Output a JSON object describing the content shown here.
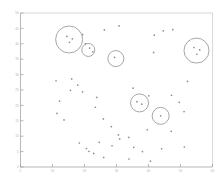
{
  "chart_data": {
    "type": "scatter",
    "title": "",
    "subtitle": "",
    "xlabel": "",
    "ylabel": "",
    "grid": false,
    "legend": "none",
    "xlim": [
      0,
      60
    ],
    "ylim": [
      0,
      50
    ],
    "xticks": [
      0,
      10,
      20,
      30,
      40,
      50,
      60
    ],
    "xticklabels": [
      "0",
      "10",
      "20",
      "30",
      "40",
      "50",
      "60"
    ],
    "yticks": [
      0,
      5,
      10,
      15,
      20,
      25,
      30,
      35,
      40,
      45,
      50
    ],
    "yticklabels": [
      "0",
      "5",
      "10",
      "15",
      "20",
      "25",
      "30",
      "35",
      "40",
      "45",
      "50"
    ],
    "series": [
      {
        "name": "points",
        "marker": "dot",
        "color": "#8d8d8d",
        "points": [
          {
            "x": 14.5,
            "y": 42.4
          },
          {
            "x": 16.2,
            "y": 41.6
          },
          {
            "x": 15.3,
            "y": 40.5
          },
          {
            "x": 19.4,
            "y": 43.0
          },
          {
            "x": 20.3,
            "y": 40.0
          },
          {
            "x": 21.6,
            "y": 38.6
          },
          {
            "x": 22.6,
            "y": 37.4
          },
          {
            "x": 26.2,
            "y": 44.5
          },
          {
            "x": 30.8,
            "y": 45.8
          },
          {
            "x": 29.4,
            "y": 35.6
          },
          {
            "x": 41.8,
            "y": 42.8
          },
          {
            "x": 44.6,
            "y": 44.2
          },
          {
            "x": 47.6,
            "y": 44.6
          },
          {
            "x": 41.6,
            "y": 37.2
          },
          {
            "x": 54.2,
            "y": 38.8
          },
          {
            "x": 56.0,
            "y": 38.0
          },
          {
            "x": 55.1,
            "y": 36.6
          },
          {
            "x": 11.1,
            "y": 28.0
          },
          {
            "x": 16.0,
            "y": 28.6
          },
          {
            "x": 17.9,
            "y": 26.6
          },
          {
            "x": 15.6,
            "y": 24.9
          },
          {
            "x": 19.4,
            "y": 24.4
          },
          {
            "x": 12.2,
            "y": 21.4
          },
          {
            "x": 23.8,
            "y": 22.6
          },
          {
            "x": 11.4,
            "y": 17.4
          },
          {
            "x": 13.6,
            "y": 15.3
          },
          {
            "x": 23.4,
            "y": 19.4
          },
          {
            "x": 25.9,
            "y": 15.6
          },
          {
            "x": 35.2,
            "y": 25.6
          },
          {
            "x": 40.1,
            "y": 23.1
          },
          {
            "x": 36.4,
            "y": 21.2
          },
          {
            "x": 37.9,
            "y": 20.4
          },
          {
            "x": 47.2,
            "y": 23.3
          },
          {
            "x": 52.2,
            "y": 27.8
          },
          {
            "x": 49.6,
            "y": 21.0
          },
          {
            "x": 51.1,
            "y": 18.0
          },
          {
            "x": 43.8,
            "y": 16.6
          },
          {
            "x": 39.6,
            "y": 12.1
          },
          {
            "x": 47.1,
            "y": 11.6
          },
          {
            "x": 28.4,
            "y": 13.1
          },
          {
            "x": 30.6,
            "y": 10.4
          },
          {
            "x": 31.0,
            "y": 9.1
          },
          {
            "x": 33.8,
            "y": 9.6
          },
          {
            "x": 24.6,
            "y": 8.0
          },
          {
            "x": 18.4,
            "y": 7.8
          },
          {
            "x": 20.6,
            "y": 6.0
          },
          {
            "x": 21.4,
            "y": 5.1
          },
          {
            "x": 22.9,
            "y": 4.4
          },
          {
            "x": 28.6,
            "y": 6.9
          },
          {
            "x": 35.4,
            "y": 6.4
          },
          {
            "x": 38.1,
            "y": 5.0
          },
          {
            "x": 44.1,
            "y": 5.9
          },
          {
            "x": 51.2,
            "y": 6.5
          },
          {
            "x": 26.0,
            "y": 3.1
          },
          {
            "x": 33.9,
            "y": 2.6
          },
          {
            "x": 40.6,
            "y": 1.9
          }
        ]
      }
    ],
    "clusters": [
      {
        "id": "cluster-1",
        "cx": 15.2,
        "cy": 41.4,
        "r_px": 13.5,
        "count": 3
      },
      {
        "id": "cluster-2",
        "cx": 21.2,
        "cy": 38.0,
        "r_px": 6.5,
        "count": 1
      },
      {
        "id": "cluster-3",
        "cx": 29.8,
        "cy": 35.2,
        "r_px": 8.0,
        "count": 1
      },
      {
        "id": "cluster-4",
        "cx": 55.0,
        "cy": 37.8,
        "r_px": 12.5,
        "count": 3
      },
      {
        "id": "cluster-5",
        "cx": 37.2,
        "cy": 20.8,
        "r_px": 9.0,
        "count": 2
      },
      {
        "id": "cluster-6",
        "cx": 43.8,
        "cy": 16.6,
        "r_px": 8.5,
        "count": 2
      }
    ]
  }
}
